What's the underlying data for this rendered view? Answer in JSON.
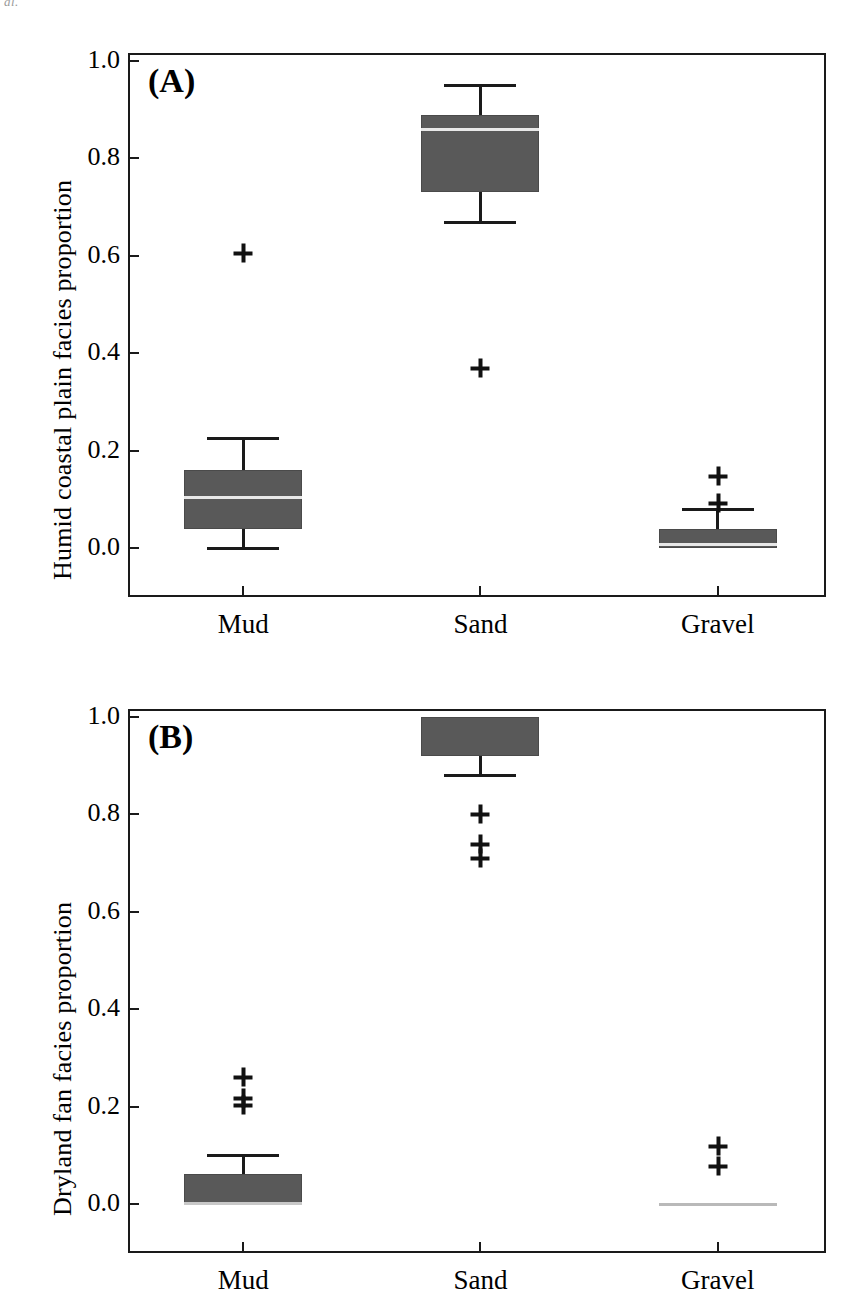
{
  "figure": {
    "crop_artifact_text": "al.",
    "background_color": "#ffffff",
    "box_fill_color": "#595959",
    "line_color": "#1a1a1a",
    "median_color": "#e8e8e8",
    "outlier_marker": "plus-icon"
  },
  "chart_data": [
    {
      "type": "box",
      "panel_label": "(A)",
      "title": "",
      "xlabel": "",
      "ylabel": "Humid coastal plain facies proportion",
      "categories": [
        "Mud",
        "Sand",
        "Gravel"
      ],
      "ylim": [
        0.0,
        1.0
      ],
      "yticks": [
        "0.0",
        "0.2",
        "0.4",
        "0.6",
        "0.8",
        "1.0"
      ],
      "ytick_values": [
        0.0,
        0.2,
        0.4,
        0.6,
        0.8,
        1.0
      ],
      "grid": false,
      "legend": "none",
      "boxes": [
        {
          "category": "Mud",
          "whisker_low": 0.0,
          "q1": 0.04,
          "median": 0.105,
          "q3": 0.16,
          "whisker_high": 0.225,
          "outliers": [
            0.605
          ]
        },
        {
          "category": "Sand",
          "whisker_low": 0.67,
          "q1": 0.73,
          "median": 0.86,
          "q3": 0.89,
          "whisker_high": 0.95,
          "outliers": [
            0.37
          ]
        },
        {
          "category": "Gravel",
          "whisker_low": 0.0,
          "q1": 0.0,
          "median": 0.008,
          "q3": 0.04,
          "whisker_high": 0.08,
          "outliers": [
            0.147,
            0.093
          ]
        }
      ]
    },
    {
      "type": "box",
      "panel_label": "(B)",
      "title": "",
      "xlabel": "",
      "ylabel": "Dryland fan facies proportion",
      "categories": [
        "Mud",
        "Sand",
        "Gravel"
      ],
      "ylim": [
        0.0,
        1.0
      ],
      "yticks": [
        "0.0",
        "0.2",
        "0.4",
        "0.6",
        "0.8",
        "1.0"
      ],
      "ytick_values": [
        0.0,
        0.2,
        0.4,
        0.6,
        0.8,
        1.0
      ],
      "grid": false,
      "legend": "none",
      "boxes": [
        {
          "category": "Mud",
          "whisker_low": 0.0,
          "q1": 0.0,
          "median": 0.0,
          "q3": 0.062,
          "whisker_high": 0.1,
          "outliers": [
            0.26,
            0.218,
            0.203
          ]
        },
        {
          "category": "Sand",
          "whisker_low": 0.88,
          "q1": 0.92,
          "median": 1.0,
          "q3": 1.0,
          "whisker_high": 1.0,
          "outliers": [
            0.8,
            0.74,
            0.71
          ]
        },
        {
          "category": "Gravel",
          "whisker_low": 0.0,
          "q1": 0.0,
          "median": 0.0,
          "q3": 0.0,
          "whisker_high": 0.0,
          "outliers": [
            0.12,
            0.078
          ]
        }
      ]
    }
  ]
}
